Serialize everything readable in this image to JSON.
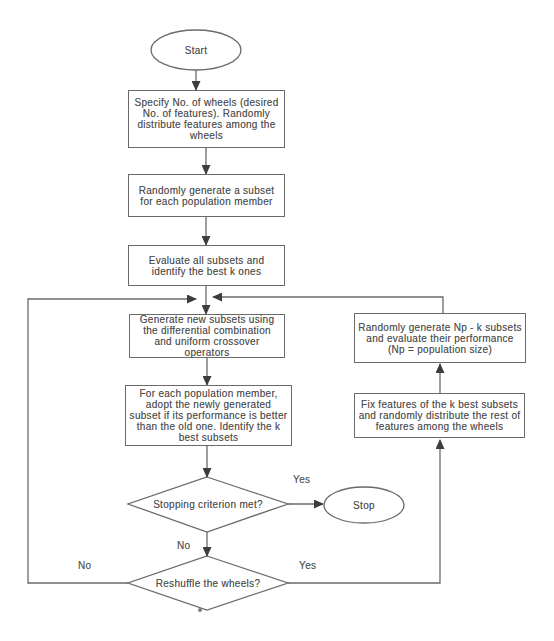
{
  "figure_type": "flowchart",
  "colors": {
    "background": "#ffffff",
    "ink": "#6a6a6a",
    "text": "#4f4f4f",
    "arrowhead": "#3d3d3d"
  },
  "nodes": [
    {
      "id": "start",
      "shape": "terminator",
      "label": "Start"
    },
    {
      "id": "specify-wheels",
      "shape": "process",
      "label": "Specify No. of wheels (desired No. of features). Randomly distribute features among the wheels"
    },
    {
      "id": "generate-population-subsets",
      "shape": "process",
      "label": "Randomly generate a subset for each population member"
    },
    {
      "id": "evaluate-subsets",
      "shape": "process",
      "label": "Evaluate all subsets and identify the best k ones"
    },
    {
      "id": "generate-new-subsets",
      "shape": "process",
      "label": "Generate new subsets using the differential combination and uniform crossover operators"
    },
    {
      "id": "adopt-subsets",
      "shape": "process",
      "label": "For each population member, adopt the newly generated subset if its performance is better than the old one. Identify the k best subsets"
    },
    {
      "id": "stopping-criterion",
      "shape": "decision",
      "label": "Stopping criterion met?"
    },
    {
      "id": "stop",
      "shape": "terminator",
      "label": "Stop"
    },
    {
      "id": "reshuffle-wheels",
      "shape": "decision",
      "label": "Reshuffle the wheels?"
    },
    {
      "id": "random-np-k",
      "shape": "process",
      "label": "Randomly generate Np - k subsets and evaluate their performance (Np = population size)"
    },
    {
      "id": "fix-features",
      "shape": "process",
      "label": "Fix features of the k best subsets and randomly distribute the rest of features among the wheels"
    }
  ],
  "edge_labels": [
    {
      "id": "stopping-yes",
      "text": "Yes"
    },
    {
      "id": "stopping-no",
      "text": "No"
    },
    {
      "id": "reshuffle-no",
      "text": "No"
    },
    {
      "id": "reshuffle-yes",
      "text": "Yes"
    }
  ]
}
